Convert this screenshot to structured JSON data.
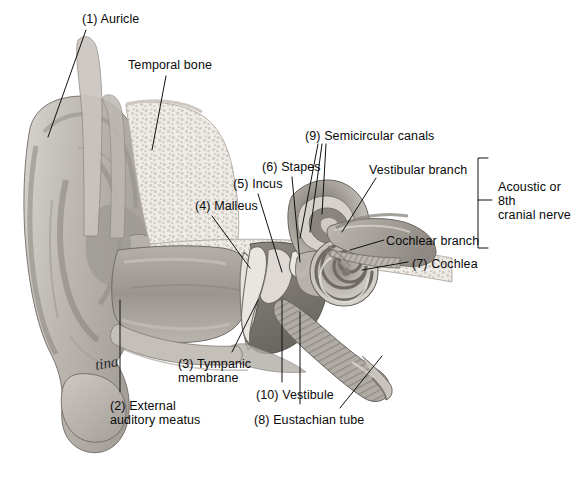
{
  "figure": {
    "background_color": "#ffffff",
    "ink_color": "#0a0a0a",
    "signature": "tina",
    "caption": "",
    "width": 581,
    "height": 492
  },
  "labels": [
    {
      "id": "auricle",
      "text": "(1) Auricle",
      "x": 82,
      "y": 12,
      "align": "left"
    },
    {
      "id": "temporal-bone",
      "text": "Temporal bone",
      "x": 128,
      "y": 58,
      "align": "left"
    },
    {
      "id": "semicircular-canals",
      "text": "(9) Semicircular canals",
      "x": 305,
      "y": 129,
      "align": "left"
    },
    {
      "id": "stapes",
      "text": "(6) Stapes",
      "x": 262,
      "y": 160,
      "align": "left"
    },
    {
      "id": "vestibular-branch",
      "text": "Vestibular branch",
      "x": 369,
      "y": 163,
      "align": "left"
    },
    {
      "id": "incus",
      "text": "(5) Incus",
      "x": 233,
      "y": 177,
      "align": "left"
    },
    {
      "id": "acoustic-nerve",
      "text": "Acoustic or\n8th\ncranial nerve",
      "x": 498,
      "y": 180,
      "align": "left"
    },
    {
      "id": "malleus",
      "text": "(4) Malleus",
      "x": 195,
      "y": 199,
      "align": "left"
    },
    {
      "id": "cochlear-branch",
      "text": "Cochlear branch",
      "x": 386,
      "y": 234,
      "align": "left"
    },
    {
      "id": "cochlea",
      "text": "(7) Cochlea",
      "x": 412,
      "y": 257,
      "align": "left"
    },
    {
      "id": "tympanic-membrane",
      "text": "(3) Tympanic\nmembrane",
      "x": 178,
      "y": 357,
      "align": "left"
    },
    {
      "id": "vestibule",
      "text": "(10) Vestibule",
      "x": 256,
      "y": 388,
      "align": "left"
    },
    {
      "id": "external-auditory-meatus",
      "text": "(2) External\nauditory meatus",
      "x": 110,
      "y": 399,
      "align": "left"
    },
    {
      "id": "eustachian-tube",
      "text": "(8) Eustachian tube",
      "x": 254,
      "y": 413,
      "align": "left"
    }
  ],
  "structures": [
    {
      "id": "auricle",
      "number": 1,
      "name": "Auricle"
    },
    {
      "id": "external-auditory-meatus",
      "number": 2,
      "name": "External auditory meatus"
    },
    {
      "id": "tympanic-membrane",
      "number": 3,
      "name": "Tympanic membrane"
    },
    {
      "id": "malleus",
      "number": 4,
      "name": "Malleus"
    },
    {
      "id": "incus",
      "number": 5,
      "name": "Incus"
    },
    {
      "id": "stapes",
      "number": 6,
      "name": "Stapes"
    },
    {
      "id": "cochlea",
      "number": 7,
      "name": "Cochlea"
    },
    {
      "id": "eustachian-tube",
      "number": 8,
      "name": "Eustachian tube"
    },
    {
      "id": "semicircular-canals",
      "number": 9,
      "name": "Semicircular canals"
    },
    {
      "id": "vestibule",
      "number": 10,
      "name": "Vestibule"
    },
    {
      "id": "temporal-bone",
      "number": null,
      "name": "Temporal bone"
    },
    {
      "id": "vestibular-branch",
      "number": null,
      "name": "Vestibular branch"
    },
    {
      "id": "cochlear-branch",
      "number": null,
      "name": "Cochlear branch"
    },
    {
      "id": "acoustic-nerve",
      "number": null,
      "name": "Acoustic or 8th cranial nerve"
    }
  ],
  "palette": {
    "bone_light": "#f2f0ed",
    "bone_mid": "#dcd8d3",
    "tissue_light": "#cfcbc6",
    "tissue_mid": "#aaa5a0",
    "tissue_dark": "#8a857f",
    "cavity_dark": "#6e6a65",
    "outline": "#55514d",
    "leader": "#111111"
  }
}
